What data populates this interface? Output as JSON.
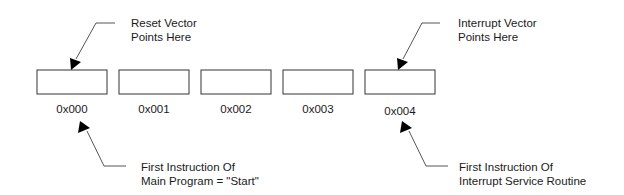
{
  "diagram": {
    "memory_cells": [
      {
        "address": "0x000"
      },
      {
        "address": "0x001"
      },
      {
        "address": "0x002"
      },
      {
        "address": "0x003"
      },
      {
        "address": "0x004"
      }
    ],
    "annotations": {
      "reset_vector": {
        "line1": "Reset Vector",
        "line2": "Points Here"
      },
      "interrupt_vector": {
        "line1": "Interrupt Vector",
        "line2": "Points Here"
      },
      "main_program": {
        "line1": "First Instruction Of",
        "line2": "Main Program = \"Start\""
      },
      "isr": {
        "line1": "First Instruction Of",
        "line2": "Interrupt Service Routine"
      }
    }
  }
}
